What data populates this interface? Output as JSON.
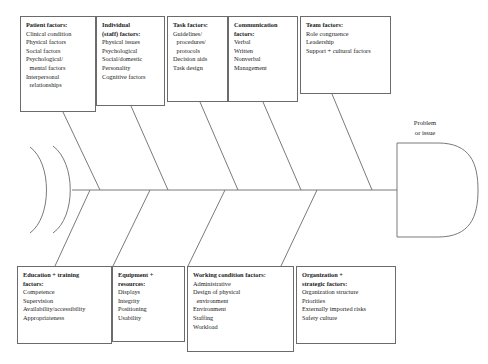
{
  "diagram": {
    "type": "fishbone-ishikawa",
    "effect": {
      "label_line1": "Problem",
      "label_line2": "or issue"
    },
    "stroke_color": "#6b6b6b",
    "text_color": "#1a1a1a",
    "background_color": "#ffffff",
    "top_categories": [
      {
        "id": "patient-factors",
        "title": "Patient factors:",
        "items": [
          {
            "text": "Clinical condition",
            "continuation": false
          },
          {
            "text": "Physical factors",
            "continuation": false
          },
          {
            "text": "Social factors",
            "continuation": false
          },
          {
            "text": "Psychological/",
            "continuation": false
          },
          {
            "text": "mental factors",
            "continuation": true
          },
          {
            "text": "Interpersonal",
            "continuation": false
          },
          {
            "text": "relationships",
            "continuation": true
          }
        ]
      },
      {
        "id": "individual-staff-factors",
        "title": "Individual\n(staff) factors:",
        "items": [
          {
            "text": "Physical issues",
            "continuation": false
          },
          {
            "text": "Psychological",
            "continuation": false
          },
          {
            "text": "Social/domestic",
            "continuation": false
          },
          {
            "text": "Personality",
            "continuation": false
          },
          {
            "text": "Cognitive factors",
            "continuation": false
          }
        ]
      },
      {
        "id": "task-factors",
        "title": "Task factors:",
        "items": [
          {
            "text": "Guidelines/",
            "continuation": false
          },
          {
            "text": "procedures/",
            "continuation": true
          },
          {
            "text": "protocols",
            "continuation": true
          },
          {
            "text": "Decision aids",
            "continuation": false
          },
          {
            "text": "Task design",
            "continuation": false
          }
        ]
      },
      {
        "id": "communication-factors",
        "title": "Communication\nfactors:",
        "items": [
          {
            "text": "Verbal",
            "continuation": false
          },
          {
            "text": "Written",
            "continuation": false
          },
          {
            "text": "Nonverbal",
            "continuation": false
          },
          {
            "text": "Management",
            "continuation": false
          }
        ]
      },
      {
        "id": "team-factors",
        "title": "Team factors:",
        "items": [
          {
            "text": "Role congruence",
            "continuation": false
          },
          {
            "text": "Leadership",
            "continuation": false
          },
          {
            "text": "Support + cultural factors",
            "continuation": false
          }
        ]
      }
    ],
    "bottom_categories": [
      {
        "id": "education-training-factors",
        "title": "Education + training\nfactors:",
        "items": [
          {
            "text": "Competence",
            "continuation": false
          },
          {
            "text": "Supervision",
            "continuation": false
          },
          {
            "text": "Availability/accessibility",
            "continuation": false
          },
          {
            "text": "Appropriateness",
            "continuation": false
          }
        ]
      },
      {
        "id": "equipment-resources",
        "title": "Equipment +\nresources:",
        "items": [
          {
            "text": "Displays",
            "continuation": false
          },
          {
            "text": "Integrity",
            "continuation": false
          },
          {
            "text": "Positioning",
            "continuation": false
          },
          {
            "text": "Usability",
            "continuation": false
          }
        ]
      },
      {
        "id": "working-condition-factors",
        "title": "Working condition factors:",
        "items": [
          {
            "text": "Administrative",
            "continuation": false
          },
          {
            "text": "Design of physical",
            "continuation": false
          },
          {
            "text": "environment",
            "continuation": true
          },
          {
            "text": "Environment",
            "continuation": false
          },
          {
            "text": "Staffing",
            "continuation": false
          },
          {
            "text": "Workload",
            "continuation": false
          }
        ]
      },
      {
        "id": "organization-strategic-factors",
        "title": "Organization +\nstrategic factors:",
        "items": [
          {
            "text": "Organization  structure",
            "continuation": false
          },
          {
            "text": "Priorities",
            "continuation": false
          },
          {
            "text": "Externally imported risks",
            "continuation": false
          },
          {
            "text": "Safety culture",
            "continuation": false
          }
        ]
      }
    ]
  }
}
